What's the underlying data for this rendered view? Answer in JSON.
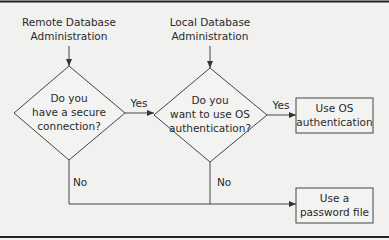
{
  "diagram": {
    "type": "flowchart",
    "start_nodes": [
      {
        "id": "remote",
        "line1": "Remote Database",
        "line2": "Administration"
      },
      {
        "id": "local",
        "line1": "Local Database",
        "line2": "Administration"
      }
    ],
    "decisions": [
      {
        "id": "secure",
        "line1": "Do you",
        "line2": "have a secure",
        "line3": "connection?"
      },
      {
        "id": "os_auth",
        "line1": "Do you",
        "line2": "want to use OS",
        "line3": "authentication?"
      }
    ],
    "outcomes": [
      {
        "id": "use_os",
        "line1": "Use OS",
        "line2": "authentication"
      },
      {
        "id": "use_pwfile",
        "line1": "Use a",
        "line2": "password file"
      }
    ],
    "edge_labels": {
      "secure_yes": "Yes",
      "secure_no": "No",
      "os_yes": "Yes",
      "os_no": "No"
    },
    "edges": [
      {
        "from": "remote",
        "to": "secure",
        "label": ""
      },
      {
        "from": "local",
        "to": "os_auth",
        "label": ""
      },
      {
        "from": "secure",
        "to": "os_auth",
        "label": "Yes"
      },
      {
        "from": "secure",
        "to": "use_pwfile",
        "label": "No"
      },
      {
        "from": "os_auth",
        "to": "use_os",
        "label": "Yes"
      },
      {
        "from": "os_auth",
        "to": "use_pwfile",
        "label": "No"
      }
    ]
  }
}
